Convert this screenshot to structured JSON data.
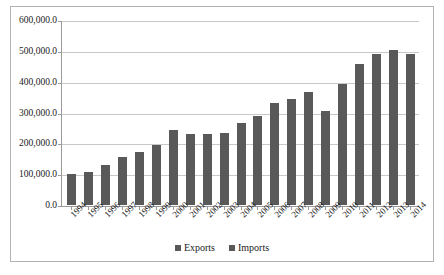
{
  "chart_data": {
    "type": "bar",
    "title": "",
    "xlabel": "",
    "ylabel": "",
    "ylim": [
      0,
      600000
    ],
    "ytick_values": [
      0,
      100000,
      200000,
      300000,
      400000,
      500000,
      600000
    ],
    "ytick_labels": [
      "0.0",
      "100,000.0",
      "200,000.0",
      "300,000.0",
      "400,000.0",
      "500,000.0",
      "600,000.0"
    ],
    "grid": true,
    "legend_position": "bottom",
    "bar_color": "#595959",
    "categories": [
      "1994",
      "1995",
      "1996",
      "1997",
      "1998",
      "1999",
      "2000",
      "2001",
      "2002",
      "2003",
      "2004",
      "2005",
      "2006",
      "2007",
      "2008",
      "2009",
      "2010",
      "2011",
      "2012",
      "2013",
      "2014"
    ],
    "legend": [
      "Exports",
      "Imports"
    ],
    "series": [
      {
        "name": "Exports",
        "color": "#595959",
        "values": [
          100000,
          108000,
          130000,
          158000,
          173000,
          197000,
          246000,
          232000,
          231000,
          235000,
          266000,
          291000,
          332000,
          346000,
          367000,
          305000,
          393000,
          461000,
          493000,
          507000,
          491000
        ]
      },
      {
        "name": "Imports",
        "color": "#595959",
        "values": [
          null,
          null,
          null,
          null,
          null,
          null,
          null,
          null,
          null,
          null,
          null,
          null,
          null,
          null,
          null,
          null,
          null,
          null,
          null,
          null,
          null
        ]
      }
    ]
  }
}
